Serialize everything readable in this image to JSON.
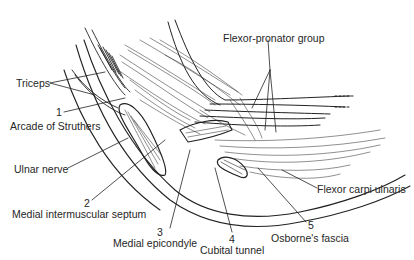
{
  "figure": {
    "labels": {
      "triceps": "Triceps",
      "flexor_pronator_group": "Flexor-pronator group",
      "arcade_of_struthers": "Arcade of Struthers",
      "ulnar_nerve": "Ulnar nerve",
      "medial_intermuscular_septum": "Medial intermuscular septum",
      "medial_epicondyle": "Medial epicondyle",
      "cubital_tunnel": "Cubital tunnel",
      "osbornes_fascia": "Osborne's fascia",
      "flexor_carpi_ulnaris": "Flexor carpi ulnaris"
    },
    "numbers": {
      "n1": "1",
      "n2": "2",
      "n3": "3",
      "n4": "4",
      "n5": "5"
    },
    "colors": {
      "ink": "#222222",
      "background": "#ffffff"
    }
  }
}
